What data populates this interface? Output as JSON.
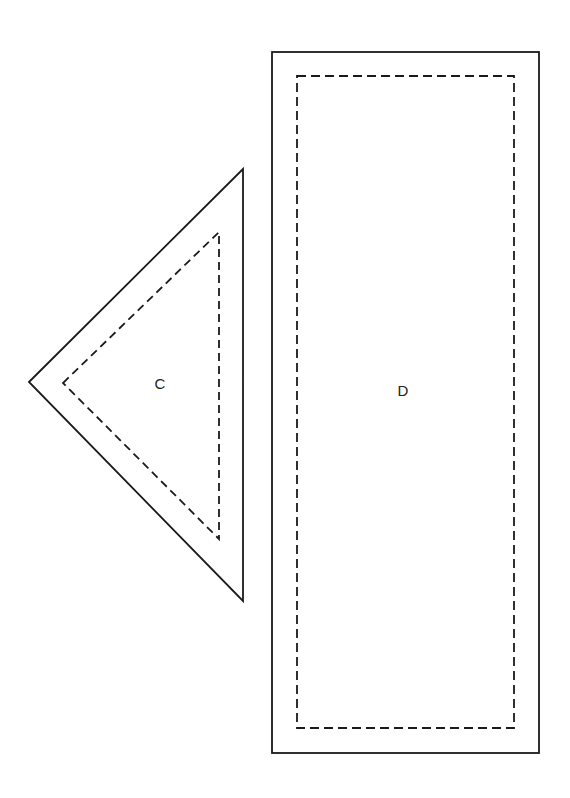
{
  "diagram": {
    "colors": {
      "background": "#ffffff",
      "stroke": "#1a1a1a",
      "text": "#222222"
    },
    "pieces": [
      {
        "id": "C",
        "label": "C",
        "shape": "triangle",
        "cut_line": {
          "style": "solid",
          "points": [
            [
              29,
              382
            ],
            [
              243,
              169
            ],
            [
              243,
              601
            ]
          ]
        },
        "seam_line": {
          "style": "dashed",
          "points": [
            [
              63,
              383
            ],
            [
              219,
              232
            ],
            [
              219,
              539
            ]
          ]
        },
        "label_pos": [
          160,
          383
        ]
      },
      {
        "id": "D",
        "label": "D",
        "shape": "rectangle",
        "cut_line": {
          "style": "solid",
          "x": 272,
          "y": 52,
          "width": 267,
          "height": 701
        },
        "seam_line": {
          "style": "dashed",
          "x": 297,
          "y": 76,
          "width": 217,
          "height": 652
        },
        "label_pos": [
          403,
          390
        ]
      }
    ]
  }
}
